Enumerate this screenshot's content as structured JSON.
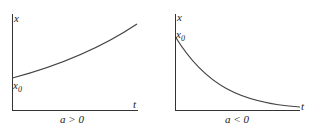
{
  "panels": [
    {
      "y_label": "x",
      "x_label": "t",
      "intercept_label": "x",
      "intercept_sub": "0",
      "caption": "a > 0",
      "trend": "exponential growth"
    },
    {
      "y_label": "x",
      "x_label": "t",
      "intercept_label": "x",
      "intercept_sub": "0",
      "caption": "a < 0",
      "trend": "exponential decay"
    }
  ],
  "colors": {
    "axis": "#333333",
    "curve": "#444444",
    "text": "#222222"
  }
}
